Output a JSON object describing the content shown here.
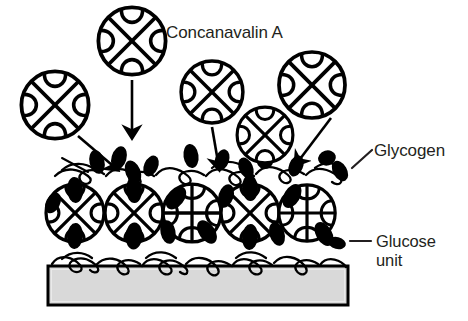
{
  "figure": {
    "background_color": "#ffffff",
    "ink_color": "#000000",
    "text_color": "#231f20",
    "width": 468,
    "height": 321
  },
  "labels": {
    "conA": "Concanavalin A",
    "glycogen": "Glycogen",
    "glucose_line1": "Glucose",
    "glucose_line2": "unit"
  },
  "legend_entries": [
    {
      "name": "concanavalin-a",
      "label": "Concanavalin A",
      "shape": "circle-with-cross-and-four-petals",
      "fill": "#ffffff",
      "stroke": "#000000"
    },
    {
      "name": "glycogen",
      "label": "Glycogen",
      "shape": "squiggly-branched-chain",
      "fill": "none",
      "stroke": "#000000"
    },
    {
      "name": "glucose-unit",
      "label": "Glucose unit",
      "shape": "filled-ellipse",
      "fill": "#000000",
      "stroke": "#000000"
    }
  ],
  "substrate": {
    "name": "substrate-slab",
    "x": 48,
    "y": 266,
    "width": 300,
    "height": 39,
    "fill": "#d9d9d9",
    "stroke": "#000000",
    "stroke_width": 3
  },
  "free_conA": [
    {
      "id": "conA-free-top",
      "cx": 132,
      "cy": 41,
      "r": 34,
      "cross": "x"
    },
    {
      "id": "conA-free-left",
      "cx": 55,
      "cy": 105,
      "r": 34,
      "cross": "x"
    },
    {
      "id": "conA-free-mid-right",
      "cx": 212,
      "cy": 92,
      "r": 31,
      "cross": "x"
    },
    {
      "id": "conA-free-right",
      "cx": 312,
      "cy": 85,
      "r": 33,
      "cross": "x"
    },
    {
      "id": "conA-free-lower-mid",
      "cx": 265,
      "cy": 135,
      "r": 28,
      "cross": "x"
    }
  ],
  "bound_conA": [
    {
      "id": "conA-bound-1",
      "cx": 75,
      "cy": 213,
      "r": 29,
      "cross": "x"
    },
    {
      "id": "conA-bound-2",
      "cx": 134,
      "cy": 213,
      "r": 29,
      "cross": "x"
    },
    {
      "id": "conA-bound-3",
      "cx": 192,
      "cy": 213,
      "r": 29,
      "cross": "plus"
    },
    {
      "id": "conA-bound-4",
      "cx": 250,
      "cy": 213,
      "r": 29,
      "cross": "x"
    },
    {
      "id": "conA-bound-5",
      "cx": 307,
      "cy": 213,
      "r": 28,
      "cross": "plus"
    }
  ],
  "arrows": [
    {
      "id": "arrow-top-down",
      "x1": 132,
      "y1": 80,
      "x2": 132,
      "y2": 131
    },
    {
      "id": "arrow-left-diagonal",
      "x1": 78,
      "y1": 135,
      "x2": 113,
      "y2": 166
    },
    {
      "id": "arrow-mid-right-down",
      "x1": 212,
      "y1": 126,
      "x2": 218,
      "y2": 163
    },
    {
      "id": "arrow-right-diagonal",
      "x1": 330,
      "y1": 117,
      "x2": 299,
      "y2": 160
    }
  ],
  "leaders": [
    {
      "id": "leader-glycogen",
      "x1": 352,
      "y1": 167,
      "x2": 372,
      "y2": 150
    },
    {
      "id": "leader-glucose",
      "x1": 350,
      "y1": 241,
      "x2": 372,
      "y2": 241
    }
  ],
  "text_positions": {
    "conA": {
      "x": 166,
      "y": 38
    },
    "glycogen": {
      "x": 374,
      "y": 156
    },
    "glucose_line1": {
      "x": 376,
      "y": 247
    },
    "glucose_line2": {
      "x": 376,
      "y": 266
    }
  }
}
